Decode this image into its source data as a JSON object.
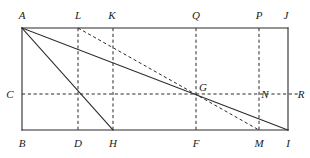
{
  "figure": {
    "kind": "geometry-diagram",
    "colors": {
      "stroke": "#2b2b2b",
      "dashed_stroke": "#2b2b2b",
      "background": "#ffffff",
      "label": "#1a1a1a"
    },
    "canvas": {
      "width": 310,
      "height": 158
    },
    "points": [
      {
        "id": "A",
        "label": "A",
        "x": 22,
        "y": 28,
        "label_x": 22,
        "label_y": 15
      },
      {
        "id": "L",
        "label": "L",
        "x": 78,
        "y": 28,
        "label_x": 78,
        "label_y": 15
      },
      {
        "id": "K",
        "label": "K",
        "x": 113,
        "y": 28,
        "label_x": 112,
        "label_y": 15
      },
      {
        "id": "Q",
        "label": "Q",
        "x": 196,
        "y": 28,
        "label_x": 196,
        "label_y": 15
      },
      {
        "id": "P",
        "label": "P",
        "x": 259,
        "y": 28,
        "label_x": 259,
        "label_y": 15
      },
      {
        "id": "J",
        "label": "J",
        "x": 288,
        "y": 28,
        "label_x": 286,
        "label_y": 15
      },
      {
        "id": "C",
        "label": "C",
        "x": 22,
        "y": 94,
        "label_x": 10,
        "label_y": 94
      },
      {
        "id": "G",
        "label": "G",
        "x": 196,
        "y": 94,
        "label_x": 203,
        "label_y": 87
      },
      {
        "id": "N",
        "label": "N",
        "x": 259,
        "y": 94,
        "label_x": 265,
        "label_y": 94
      },
      {
        "id": "R",
        "label": "R",
        "x": 300,
        "y": 94,
        "label_x": 301,
        "label_y": 94
      },
      {
        "id": "B",
        "label": "B",
        "x": 22,
        "y": 130,
        "label_x": 22,
        "label_y": 143
      },
      {
        "id": "D",
        "label": "D",
        "x": 78,
        "y": 130,
        "label_x": 78,
        "label_y": 143
      },
      {
        "id": "H",
        "label": "H",
        "x": 113,
        "y": 130,
        "label_x": 113,
        "label_y": 143
      },
      {
        "id": "F",
        "label": "F",
        "x": 196,
        "y": 130,
        "label_x": 196,
        "label_y": 143
      },
      {
        "id": "M",
        "label": "M",
        "x": 259,
        "y": 130,
        "label_x": 259,
        "label_y": 143
      },
      {
        "id": "I",
        "label": "I",
        "x": 288,
        "y": 130,
        "label_x": 288,
        "label_y": 143
      }
    ],
    "solid_segments": [
      {
        "name": "side-AJ-top",
        "from": "A",
        "to": "J"
      },
      {
        "name": "side-BI-bottom",
        "from": "B",
        "to": "I"
      },
      {
        "name": "side-AB-left",
        "from": "A",
        "to": "B"
      },
      {
        "name": "side-JI-right",
        "from": "J",
        "to": "I"
      },
      {
        "name": "diagonal-A-to-I",
        "from": "A",
        "to": "I"
      },
      {
        "name": "segment-A-to-H",
        "from": "A",
        "to": "H"
      }
    ],
    "dashed_segments": [
      {
        "name": "vertical-L-to-D",
        "from": "L",
        "to": "D"
      },
      {
        "name": "vertical-K-to-H",
        "from": "K",
        "to": "H"
      },
      {
        "name": "vertical-Q-to-F",
        "from": "Q",
        "to": "F"
      },
      {
        "name": "vertical-P-to-M",
        "from": "P",
        "to": "M"
      },
      {
        "name": "horizontal-C-to-R",
        "from": "C",
        "to": "R"
      },
      {
        "name": "segment-L-to-M",
        "from": "L",
        "to": "M"
      }
    ]
  }
}
